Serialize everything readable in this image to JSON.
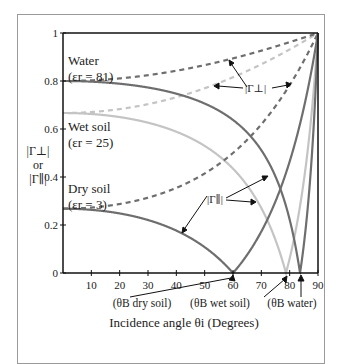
{
  "chart_data": {
    "type": "line",
    "title": "",
    "xlabel": "Incidence angle θi (Degrees)",
    "ylabel": "|Γ⊥| or |Γ∥|",
    "xlim": [
      0,
      90
    ],
    "ylim": [
      0,
      1
    ],
    "x_ticks": [
      10,
      20,
      30,
      40,
      50,
      60,
      70,
      80,
      90
    ],
    "y_ticks": [
      0,
      0.2,
      0.4,
      0.6,
      0.8,
      1
    ],
    "y_tick_labels": [
      "0",
      "0.2",
      "0.4",
      "0.6",
      "0.8",
      "1"
    ],
    "grid": false,
    "materials": [
      {
        "name": "Water",
        "epsilon_r": 81,
        "label": "Water",
        "sub_label": "(εr = 81)",
        "color": "#6e6e6e",
        "brewster_angle": 83.7
      },
      {
        "name": "Wet soil",
        "epsilon_r": 25,
        "label": "Wet soil",
        "sub_label": "(εr = 25)",
        "color": "#c4c4c4",
        "brewster_angle": 78.7
      },
      {
        "name": "Dry soil",
        "epsilon_r": 3,
        "label": "Dry soil",
        "sub_label": "(εr = 3)",
        "color": "#6e6e6e",
        "brewster_angle": 60.0
      }
    ],
    "series": [
      {
        "name": "Water |Γ⊥|",
        "style": "dashed",
        "x": [
          0,
          30,
          60,
          80,
          90
        ],
        "values": [
          0.8,
          0.82,
          0.87,
          0.94,
          1.0
        ]
      },
      {
        "name": "Water |Γ∥|",
        "style": "solid",
        "x": [
          0,
          30,
          60,
          80,
          83.7,
          90
        ],
        "values": [
          0.8,
          0.78,
          0.69,
          0.29,
          0.0,
          1.0
        ]
      },
      {
        "name": "Wet soil |Γ⊥|",
        "style": "dashed",
        "x": [
          0,
          30,
          60,
          80,
          90
        ],
        "values": [
          0.67,
          0.69,
          0.77,
          0.9,
          1.0
        ]
      },
      {
        "name": "Wet soil |Γ∥|",
        "style": "solid",
        "x": [
          0,
          30,
          60,
          78.7,
          90
        ],
        "values": [
          0.67,
          0.64,
          0.5,
          0.0,
          1.0
        ]
      },
      {
        "name": "Dry soil |Γ⊥|",
        "style": "dashed",
        "x": [
          0,
          30,
          60,
          80,
          90
        ],
        "values": [
          0.27,
          0.32,
          0.5,
          0.77,
          1.0
        ]
      },
      {
        "name": "Dry soil |Γ∥|",
        "style": "solid",
        "x": [
          0,
          30,
          60,
          80,
          90
        ],
        "values": [
          0.27,
          0.23,
          0.0,
          0.53,
          1.0
        ]
      }
    ],
    "annotations": [
      {
        "text": "|Γ⊥|",
        "target": "perpendicular (dashed) curves"
      },
      {
        "text": "|Γ∥|",
        "target": "parallel (solid) curves"
      },
      {
        "text": "(θB dry soil)",
        "x": 60
      },
      {
        "text": "(θB wet soil)",
        "x": 78.7
      },
      {
        "text": "(θB water)",
        "x": 83.7
      }
    ]
  },
  "labels": {
    "water": "Water",
    "water_eps": "(εr = 81)",
    "wet": "Wet soil",
    "wet_eps": "(εr = 25)",
    "dry": "Dry soil",
    "dry_eps": "(εr = 3)",
    "gperp": "|Γ⊥|",
    "gpar": "|Γ∥|",
    "ylabel_1": "|Γ⊥|",
    "ylabel_2": "or",
    "ylabel_3": "|Γ∥|",
    "b_dry": "(θB dry soil)",
    "b_wet": "(θB wet soil)",
    "b_water": "(θB water)",
    "xlabel": "Incidence angle θi (Degrees)"
  }
}
